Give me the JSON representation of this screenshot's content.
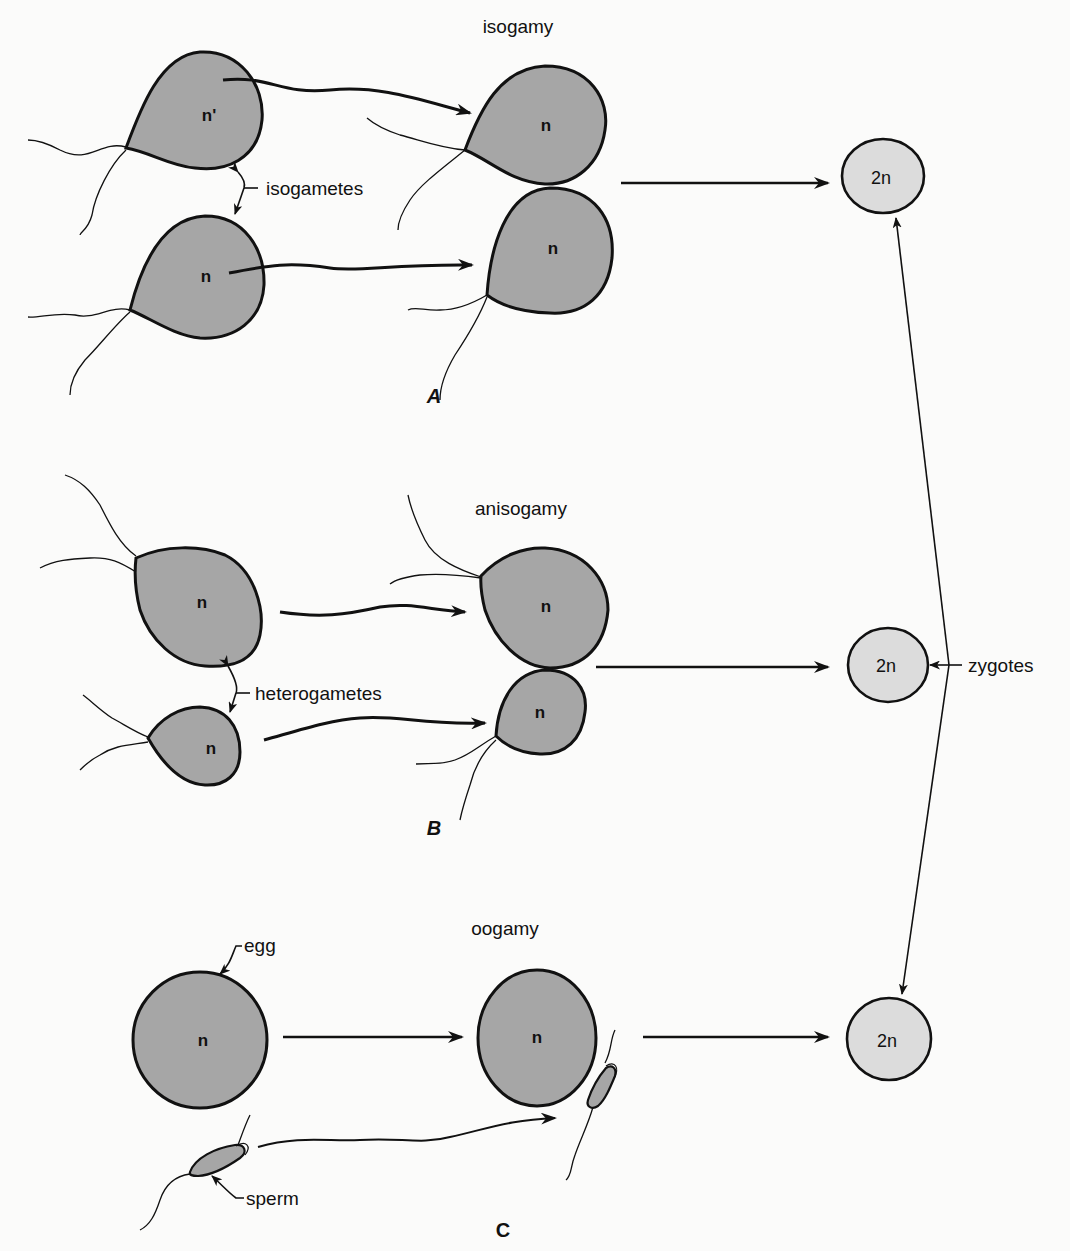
{
  "diagram": {
    "panels": [
      {
        "id": "A",
        "title": "isogamy",
        "gamete_label": "isogametes",
        "panel_letter": "A"
      },
      {
        "id": "B",
        "title": "anisogamy",
        "gamete_label": "heterogametes",
        "panel_letter": "B"
      },
      {
        "id": "C",
        "title": "oogamy",
        "egg_label": "egg",
        "sperm_label": "sperm",
        "panel_letter": "C"
      }
    ],
    "cell_labels": {
      "a_top_left": "n'",
      "haploid": "n",
      "diploid": "2n"
    },
    "zygotes_label": "zygotes",
    "colors": {
      "gamete_fill": "#a6a6a6",
      "zygote_fill": "#dcdcdc",
      "stroke": "#111111",
      "background": "#fbfbfa"
    }
  }
}
